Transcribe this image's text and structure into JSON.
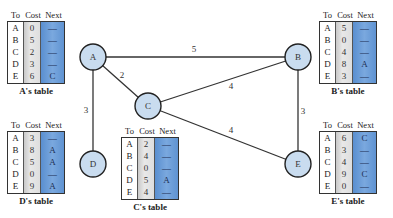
{
  "diagram": {
    "nodes": [
      {
        "id": "A",
        "label": "A",
        "cx": 93,
        "cy": 57
      },
      {
        "id": "B",
        "label": "B",
        "cx": 298,
        "cy": 57
      },
      {
        "id": "C",
        "label": "C",
        "cx": 148,
        "cy": 106
      },
      {
        "id": "D",
        "label": "D",
        "cx": 93,
        "cy": 164
      },
      {
        "id": "E",
        "label": "E",
        "cx": 298,
        "cy": 164
      }
    ],
    "edges": [
      {
        "from": "A",
        "to": "B",
        "cost": "5",
        "lx": 194,
        "ly": 52
      },
      {
        "from": "A",
        "to": "C",
        "cost": "2",
        "lx": 122,
        "ly": 78
      },
      {
        "from": "A",
        "to": "D",
        "cost": "3",
        "lx": 86,
        "ly": 113
      },
      {
        "from": "C",
        "to": "B",
        "cost": "4",
        "lx": 231,
        "ly": 89
      },
      {
        "from": "C",
        "to": "E",
        "cost": "4",
        "lx": 231,
        "ly": 133
      },
      {
        "from": "B",
        "to": "E",
        "cost": "3",
        "lx": 303,
        "ly": 114
      }
    ]
  },
  "header": {
    "to": "To",
    "cost": "Cost",
    "next": "Next"
  },
  "tables": {
    "A": {
      "caption": "A's table",
      "to": [
        "A",
        "B",
        "C",
        "D",
        "E"
      ],
      "cost": [
        "0",
        "5",
        "2",
        "3",
        "6"
      ],
      "next": [
        "—",
        "—",
        "—",
        "—",
        "C"
      ]
    },
    "B": {
      "caption": "B's table",
      "to": [
        "A",
        "B",
        "C",
        "D",
        "E"
      ],
      "cost": [
        "5",
        "0",
        "4",
        "8",
        "3"
      ],
      "next": [
        "—",
        "—",
        "—",
        "A",
        "—"
      ]
    },
    "C": {
      "caption": "C's table",
      "to": [
        "A",
        "B",
        "C",
        "D",
        "E"
      ],
      "cost": [
        "2",
        "4",
        "0",
        "5",
        "4"
      ],
      "next": [
        "—",
        "—",
        "—",
        "A",
        "—"
      ]
    },
    "D": {
      "caption": "D's table",
      "to": [
        "A",
        "B",
        "C",
        "D",
        "E"
      ],
      "cost": [
        "3",
        "8",
        "5",
        "0",
        "9"
      ],
      "next": [
        "—",
        "A",
        "A",
        "—",
        "A"
      ]
    },
    "E": {
      "caption": "E's table",
      "to": [
        "A",
        "B",
        "C",
        "D",
        "E"
      ],
      "cost": [
        "6",
        "3",
        "4",
        "9",
        "0"
      ],
      "next": [
        "C",
        "—",
        "—",
        "C",
        "—"
      ]
    }
  },
  "colors": {
    "node_fill": "#c9dcef",
    "cost_column": "#dcdcdc",
    "next_column": "#6b9bd6"
  }
}
